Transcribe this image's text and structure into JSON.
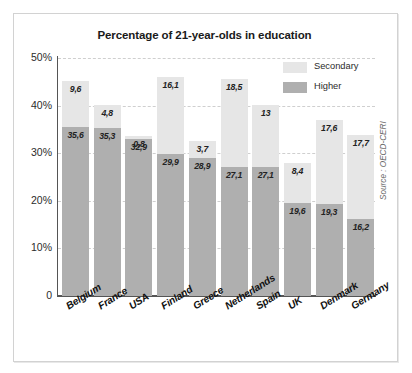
{
  "chart_data": {
    "type": "bar",
    "stacked": true,
    "title": "Percentage of 21-year-olds in education",
    "xlabel": "",
    "ylabel": "",
    "ylim": [
      0,
      50
    ],
    "grid": true,
    "legend_position": "top-right",
    "source": "Source : OECD-CERI",
    "categories": [
      "Belgium",
      "France",
      "USA",
      "Finland",
      "Greece",
      "Netherlands",
      "Spain",
      "UK",
      "Denmark",
      "Germany"
    ],
    "ytick_labels": [
      "50%",
      "40%",
      "30%",
      "20%",
      "10%",
      "0"
    ],
    "ytick_values": [
      50,
      40,
      30,
      20,
      10,
      0
    ],
    "series": [
      {
        "name": "Higher",
        "color": "#afafaf",
        "values": [
          35.6,
          35.3,
          32.9,
          29.9,
          28.9,
          27.1,
          27.1,
          19.6,
          19.3,
          16.2
        ],
        "labels": [
          "35,6",
          "35,3",
          "32,9",
          "29,9",
          "28,9",
          "27,1",
          "27,1",
          "19,6",
          "19,3",
          "16,2"
        ]
      },
      {
        "name": "Secondary",
        "color": "#e6e6e6",
        "values": [
          9.6,
          4.8,
          0.8,
          16.1,
          3.7,
          18.5,
          13.0,
          8.4,
          17.6,
          17.7
        ],
        "labels": [
          "9,6",
          "4,8",
          "0,8",
          "16,1",
          "3,7",
          "18,5",
          "13",
          "8,4",
          "17,6",
          "17,7"
        ]
      }
    ],
    "totals": [
      45.2,
      40.1,
      33.7,
      46.0,
      32.6,
      45.6,
      40.1,
      28.0,
      36.9,
      33.9
    ]
  },
  "legend": {
    "items": [
      {
        "label": "Secondary",
        "color": "#e6e6e6"
      },
      {
        "label": "Higher",
        "color": "#afafaf"
      }
    ]
  }
}
